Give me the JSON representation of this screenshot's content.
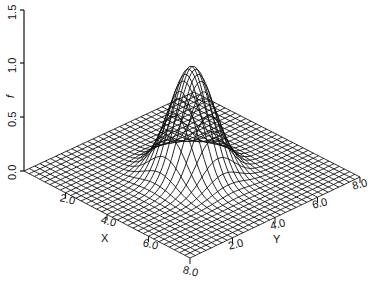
{
  "chart_data": {
    "type": "surface3d",
    "title": "",
    "function": "f(x,y) = exp(-((x-4)^2 + (y-4)^2)/2)  (Gaussian bump)",
    "xlabel": "X",
    "ylabel": "Y",
    "zlabel": "f",
    "x_range": [
      0,
      8
    ],
    "y_range": [
      0,
      8
    ],
    "z_range": [
      0,
      1.5
    ],
    "grid_lines_per_axis": 33,
    "x_ticks": [
      "2.0",
      "4.0",
      "6.0",
      "8.0"
    ],
    "y_ticks": [
      "2.0",
      "4.0",
      "6.0",
      "8.0"
    ],
    "z_ticks": [
      "0.0",
      "0.5",
      "1.0",
      "1.5"
    ],
    "peak": {
      "x": 4.0,
      "y": 4.0,
      "z": 1.0
    },
    "line_color": "#111111",
    "background": "#ffffff"
  },
  "labels": {
    "z_axis_name": "f",
    "x_axis_name": "X",
    "y_axis_name": "Y",
    "z_ticks": [
      "0.0",
      "0.5",
      "1.0",
      "1.5"
    ],
    "x_ticks": [
      "2.0",
      "4.0",
      "6.0",
      "8.0"
    ],
    "y_ticks": [
      "2.0",
      "4.0",
      "6.0",
      "8.0"
    ]
  }
}
